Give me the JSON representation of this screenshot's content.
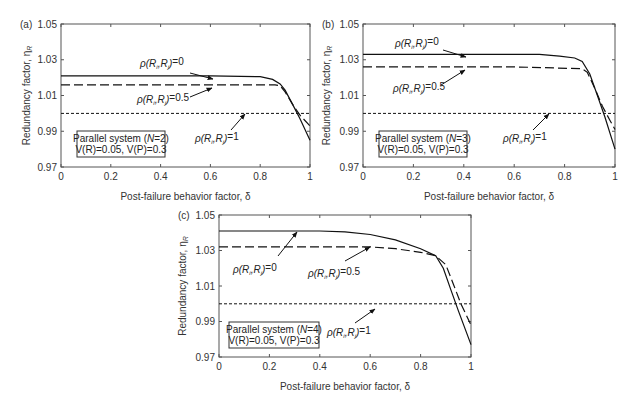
{
  "chart_data": [
    {
      "panel": "(a)",
      "type": "line",
      "xlabel": "Post-failure behavior factor, δ",
      "ylabel": "Redundancy factor, ηR",
      "xlim": [
        0,
        1
      ],
      "ylim": [
        0.97,
        1.05
      ],
      "xticks": [
        "0",
        "0.2",
        "0.4",
        "0.6",
        "0.8",
        "1"
      ],
      "yticks": [
        "0.97",
        "0.99",
        "1.01",
        "1.03",
        "1.05"
      ],
      "grid": false,
      "annotation_box": [
        "Parallel system (N=2)",
        "V(R)=0.05, V(P)=0.3"
      ],
      "series": [
        {
          "name": "ρ(Ri,Rj)=0",
          "style": "solid",
          "x": [
            0,
            0.6,
            0.8,
            0.85,
            0.88,
            0.9,
            0.93,
            0.96,
            1.0
          ],
          "y": [
            1.021,
            1.021,
            1.0205,
            1.019,
            1.0165,
            1.013,
            1.005,
            0.997,
            0.985
          ]
        },
        {
          "name": "ρ(Ri,Rj)=0.5",
          "style": "dashed",
          "x": [
            0,
            0.6,
            0.86,
            0.88,
            0.9,
            0.93,
            0.96,
            1.0
          ],
          "y": [
            1.016,
            1.016,
            1.016,
            1.0155,
            1.012,
            1.005,
            0.999,
            0.993
          ]
        },
        {
          "name": "ρ(Ri,Rj)=1",
          "style": "dotted",
          "x": [
            0,
            1
          ],
          "y": [
            1.0,
            1.0
          ]
        }
      ]
    },
    {
      "panel": "(b)",
      "type": "line",
      "xlabel": "Post-failure behavior factor, δ",
      "ylabel": "Redundancy factor, ηR",
      "xlim": [
        0,
        1
      ],
      "ylim": [
        0.97,
        1.05
      ],
      "xticks": [
        "0",
        "0.2",
        "0.4",
        "0.6",
        "0.8",
        "1"
      ],
      "yticks": [
        "0.97",
        "0.99",
        "1.01",
        "1.03",
        "1.05"
      ],
      "grid": false,
      "annotation_box": [
        "Parallel system (N=3)",
        "V(R)=0.05, V(P)=0.3"
      ],
      "series": [
        {
          "name": "ρ(Ri,Rj)=0",
          "style": "solid",
          "x": [
            0,
            0.7,
            0.78,
            0.84,
            0.87,
            0.9,
            0.93,
            0.96,
            1.0
          ],
          "y": [
            1.033,
            1.033,
            1.032,
            1.031,
            1.029,
            1.022,
            1.01,
            0.998,
            0.98
          ]
        },
        {
          "name": "ρ(Ri,Rj)=0.5",
          "style": "dashed",
          "x": [
            0,
            0.6,
            0.87,
            0.89,
            0.92,
            0.95,
            0.98,
            1.0
          ],
          "y": [
            1.026,
            1.026,
            1.025,
            1.023,
            1.014,
            1.004,
            0.996,
            0.991
          ]
        },
        {
          "name": "ρ(Ri,Rj)=1",
          "style": "dotted",
          "x": [
            0,
            1
          ],
          "y": [
            1.0,
            1.0
          ]
        }
      ]
    },
    {
      "panel": "(c)",
      "type": "line",
      "xlabel": "Post-failure behavior factor, δ",
      "ylabel": "Redundancy factor, ηR",
      "xlim": [
        0,
        1
      ],
      "ylim": [
        0.97,
        1.05
      ],
      "xticks": [
        "0",
        "0.2",
        "0.4",
        "0.6",
        "0.8",
        "1"
      ],
      "yticks": [
        "0.97",
        "0.99",
        "1.01",
        "1.03",
        "1.05"
      ],
      "grid": false,
      "annotation_box": [
        "Parallel system (N=4)",
        "V(R)=0.05, V(P)=0.3"
      ],
      "series": [
        {
          "name": "ρ(Ri,Rj)=0",
          "style": "solid",
          "x": [
            0,
            0.4,
            0.5,
            0.6,
            0.7,
            0.8,
            0.86,
            0.89,
            0.92,
            0.95,
            1.0
          ],
          "y": [
            1.041,
            1.041,
            1.0405,
            1.039,
            1.036,
            1.031,
            1.027,
            1.02,
            1.008,
            0.996,
            0.977
          ]
        },
        {
          "name": "ρ(Ri,Rj)=0.5",
          "style": "dashed",
          "x": [
            0,
            0.6,
            0.7,
            0.8,
            0.86,
            0.9,
            0.93,
            0.96,
            1.0
          ],
          "y": [
            1.032,
            1.032,
            1.031,
            1.029,
            1.027,
            1.022,
            1.011,
            1.0,
            0.988
          ]
        },
        {
          "name": "ρ(Ri,Rj)=1",
          "style": "dotted",
          "x": [
            0,
            1
          ],
          "y": [
            1.0,
            1.0
          ]
        }
      ]
    }
  ],
  "panels": [
    {
      "id": "a",
      "label": "(a)",
      "ylabel": "Redundancy factor, η",
      "ylabel_sub": "R",
      "xlabel": "Post-failure behavior factor, δ",
      "box_line1_pre": "Parallel system (",
      "box_line1_N": "N",
      "box_line1_post": "=2)",
      "rho0": "=0",
      "rho05": "=0.5",
      "rho1": "=1"
    },
    {
      "id": "b",
      "label": "(b)",
      "ylabel": "Redundancy factor, η",
      "ylabel_sub": "R",
      "xlabel": "Post-failure behavior factor, δ",
      "box_line1_pre": "Parallel system (",
      "box_line1_N": "N",
      "box_line1_post": "=3)",
      "rho0": "=0",
      "rho05": "=0.5",
      "rho1": "=1"
    },
    {
      "id": "c",
      "label": "(c)",
      "ylabel": "Redundancy factor, η",
      "ylabel_sub": "R",
      "xlabel": "Post-failure behavior factor, δ",
      "box_line1_pre": "Parallel system (",
      "box_line1_N": "N",
      "box_line1_post": "=4)",
      "rho0": "=0",
      "rho05": "=0.5",
      "rho1": "=1"
    }
  ],
  "common": {
    "box_line2": "V(R)=0.05, V(P)=0.3",
    "rho_prefix": "ρ(R",
    "rho_i": "i",
    "rho_mid": ",R",
    "rho_j": "j",
    "rho_close": ")",
    "yticks": [
      "1.05",
      "1.03",
      "1.01",
      "0.99",
      "0.97"
    ],
    "xticks": [
      "0",
      "0.2",
      "0.4",
      "0.6",
      "0.8",
      "1"
    ]
  }
}
